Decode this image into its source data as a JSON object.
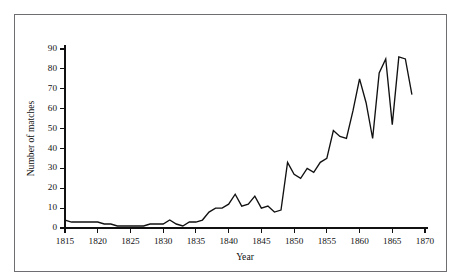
{
  "figure": {
    "top_faint_text": "",
    "border_color": "#6e6e72",
    "line_color": "#111111",
    "background": "#ffffff"
  },
  "chart_data": {
    "type": "line",
    "title": "",
    "xlabel": "Year",
    "ylabel": "Number of matches",
    "xlim": [
      1815,
      1870
    ],
    "ylim": [
      0,
      90
    ],
    "xticks": [
      1815,
      1820,
      1825,
      1830,
      1835,
      1840,
      1845,
      1850,
      1855,
      1860,
      1865,
      1870
    ],
    "yticks": [
      0,
      10,
      20,
      30,
      40,
      50,
      60,
      70,
      80,
      90
    ],
    "grid": false,
    "legend": null,
    "x": [
      1815,
      1816,
      1817,
      1818,
      1819,
      1820,
      1821,
      1822,
      1823,
      1824,
      1825,
      1826,
      1827,
      1828,
      1829,
      1830,
      1831,
      1832,
      1833,
      1834,
      1835,
      1836,
      1837,
      1838,
      1839,
      1840,
      1841,
      1842,
      1843,
      1844,
      1845,
      1846,
      1847,
      1848,
      1849,
      1850,
      1851,
      1852,
      1853,
      1854,
      1855,
      1856,
      1857,
      1858,
      1859,
      1860,
      1861,
      1862,
      1863,
      1864,
      1865,
      1866,
      1867,
      1868
    ],
    "values": [
      4,
      3,
      3,
      3,
      3,
      3,
      2,
      2,
      1,
      1,
      1,
      1,
      1,
      2,
      2,
      2,
      4,
      2,
      1,
      3,
      3,
      4,
      8,
      10,
      10,
      12,
      17,
      11,
      12,
      16,
      10,
      11,
      8,
      9,
      33,
      27,
      25,
      30,
      28,
      33,
      35,
      49,
      46,
      45,
      59,
      75,
      63,
      45,
      78,
      85,
      52,
      86,
      85,
      67
    ],
    "series": [
      {
        "name": "Number of matches",
        "values": [
          4,
          3,
          3,
          3,
          3,
          3,
          2,
          2,
          1,
          1,
          1,
          1,
          1,
          2,
          2,
          2,
          4,
          2,
          1,
          3,
          3,
          4,
          8,
          10,
          10,
          12,
          17,
          11,
          12,
          16,
          10,
          11,
          8,
          9,
          33,
          27,
          25,
          30,
          28,
          33,
          35,
          49,
          46,
          45,
          59,
          75,
          63,
          45,
          78,
          85,
          52,
          86,
          85,
          67
        ]
      }
    ]
  }
}
